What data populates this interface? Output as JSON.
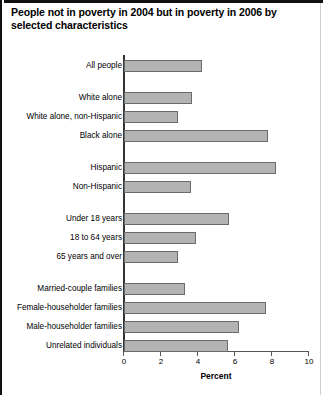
{
  "chart_data": {
    "type": "bar",
    "orientation": "horizontal",
    "title": "People not in poverty in 2004 but in poverty in 2006 by selected characteristics",
    "xlabel": "Percent",
    "ylabel": "",
    "xlim": [
      0,
      10
    ],
    "xticks": [
      0,
      2,
      4,
      6,
      8,
      10
    ],
    "xtick_labels": [
      "0",
      "2",
      "4",
      "6",
      "8",
      "10"
    ],
    "grid": false,
    "legend": "none",
    "bar_color": "#b3b3b3",
    "bar_edge_color": "#6b6b6b",
    "categories": [
      "All people",
      "White alone",
      "White alone, non-Hispanic",
      "Black alone",
      "Hispanic",
      "Non-Hispanic",
      "Under 18 years",
      "18 to 64 years",
      "65 years and over",
      "Married-couple families",
      "Female-householder families",
      "Male-householder families",
      "Unrelated individuals"
    ],
    "values": [
      4.2,
      3.7,
      2.9,
      7.8,
      8.2,
      3.6,
      5.7,
      3.9,
      2.9,
      3.3,
      7.7,
      6.2,
      5.6
    ],
    "groups": [
      {
        "name": "total",
        "categories": [
          "All people"
        ]
      },
      {
        "name": "race",
        "categories": [
          "White alone",
          "White alone, non-Hispanic",
          "Black alone"
        ]
      },
      {
        "name": "ethnicity",
        "categories": [
          "Hispanic",
          "Non-Hispanic"
        ]
      },
      {
        "name": "age",
        "categories": [
          "Under 18 years",
          "18 to 64 years",
          "65 years and over"
        ]
      },
      {
        "name": "family-type",
        "categories": [
          "Married-couple families",
          "Female-householder families",
          "Male-householder families",
          "Unrelated individuals"
        ]
      }
    ]
  }
}
